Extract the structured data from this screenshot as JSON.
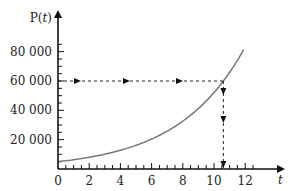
{
  "chart_data": {
    "type": "line",
    "title": "",
    "xlabel": "t",
    "ylabel": "P(t)",
    "xlim": [
      0,
      12.8
    ],
    "ylim": [
      0,
      90000
    ],
    "x_ticks": [
      0,
      2,
      4,
      6,
      8,
      10,
      12
    ],
    "x_tick_labels": [
      "0",
      "2",
      "4",
      "6",
      "8",
      "10",
      "12"
    ],
    "y_ticks": [
      20000,
      40000,
      60000,
      80000
    ],
    "y_tick_labels": [
      "20 000",
      "40 000",
      "60 000",
      "80 000"
    ],
    "grid": false,
    "legend": null,
    "series": [
      {
        "name": "P(t)",
        "description": "exponential growth curve",
        "x": [
          0,
          1,
          2,
          3,
          4,
          5,
          6,
          7,
          8,
          9,
          10,
          10.6,
          11,
          11.9
        ],
        "values": [
          5000,
          6320,
          8000,
          10110,
          12780,
          16160,
          20440,
          25840,
          32680,
          41320,
          52240,
          60000,
          65800,
          81000
        ],
        "color": "#777777"
      }
    ],
    "annotations": [
      {
        "type": "dashed-horizontal",
        "y": 60000,
        "from_x": 0,
        "to_x": 10.6,
        "arrows": "right",
        "arrow_count": 3
      },
      {
        "type": "dashed-vertical",
        "x": 10.6,
        "from_y": 60000,
        "to_y": 0,
        "arrows": "down",
        "arrow_count": 3
      }
    ]
  }
}
